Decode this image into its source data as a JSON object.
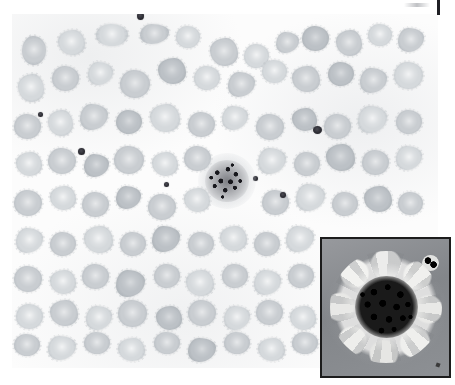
{
  "figure": {
    "kind": "micrograph",
    "caption": "",
    "background_color": "#ffffff"
  },
  "main_panel": {
    "name": "main-micrograph",
    "description": "Light-field peripheral blood smear showing numerous pale gray crenated red blood cells (echinocytes) on a white background, with a single dark basophilic granular cell cluster near the center and several small dark platelets scattered across the field.",
    "field_color": "#fcfcfc",
    "cell_color": "#c9cdd1",
    "cell_color_light": "#d5d9dc",
    "cell_color_dark": "#bcc1c6",
    "dark_object_color": "#17171c",
    "bounds": {
      "x": 12,
      "y": 14,
      "width": 426,
      "height": 354
    },
    "red_blood_cells": [
      {
        "x": 22,
        "y": 36,
        "w": 24,
        "h": 29,
        "tone": "base",
        "shape": "sp"
      },
      {
        "x": 58,
        "y": 30,
        "w": 27,
        "h": 25,
        "tone": "light",
        "shape": "sp2"
      },
      {
        "x": 96,
        "y": 24,
        "w": 32,
        "h": 22,
        "tone": "light",
        "shape": "sp"
      },
      {
        "x": 140,
        "y": 24,
        "w": 29,
        "h": 20,
        "tone": "base",
        "shape": "sp3"
      },
      {
        "x": 176,
        "y": 26,
        "w": 24,
        "h": 22,
        "tone": "light",
        "shape": "sp"
      },
      {
        "x": 210,
        "y": 38,
        "w": 28,
        "h": 28,
        "tone": "base",
        "shape": "sp2"
      },
      {
        "x": 244,
        "y": 44,
        "w": 25,
        "h": 24,
        "tone": "light",
        "shape": "sp"
      },
      {
        "x": 276,
        "y": 32,
        "w": 23,
        "h": 21,
        "tone": "base",
        "shape": "sp3"
      },
      {
        "x": 302,
        "y": 26,
        "w": 27,
        "h": 25,
        "tone": "dark",
        "shape": "sp"
      },
      {
        "x": 336,
        "y": 30,
        "w": 26,
        "h": 26,
        "tone": "base",
        "shape": "sp2"
      },
      {
        "x": 368,
        "y": 24,
        "w": 24,
        "h": 22,
        "tone": "light",
        "shape": "sp"
      },
      {
        "x": 398,
        "y": 28,
        "w": 26,
        "h": 24,
        "tone": "base",
        "shape": "sp3"
      },
      {
        "x": 18,
        "y": 74,
        "w": 26,
        "h": 28,
        "tone": "light",
        "shape": "sp2"
      },
      {
        "x": 52,
        "y": 66,
        "w": 27,
        "h": 25,
        "tone": "base",
        "shape": "sp"
      },
      {
        "x": 88,
        "y": 62,
        "w": 25,
        "h": 23,
        "tone": "light",
        "shape": "sp3"
      },
      {
        "x": 120,
        "y": 70,
        "w": 30,
        "h": 28,
        "tone": "base",
        "shape": "sp"
      },
      {
        "x": 158,
        "y": 58,
        "w": 28,
        "h": 26,
        "tone": "dark",
        "shape": "sp2"
      },
      {
        "x": 194,
        "y": 66,
        "w": 26,
        "h": 24,
        "tone": "light",
        "shape": "sp"
      },
      {
        "x": 228,
        "y": 72,
        "w": 27,
        "h": 25,
        "tone": "base",
        "shape": "sp3"
      },
      {
        "x": 262,
        "y": 60,
        "w": 25,
        "h": 23,
        "tone": "light",
        "shape": "sp"
      },
      {
        "x": 292,
        "y": 66,
        "w": 28,
        "h": 26,
        "tone": "base",
        "shape": "sp2"
      },
      {
        "x": 328,
        "y": 62,
        "w": 26,
        "h": 24,
        "tone": "dark",
        "shape": "sp"
      },
      {
        "x": 360,
        "y": 68,
        "w": 27,
        "h": 25,
        "tone": "base",
        "shape": "sp3"
      },
      {
        "x": 394,
        "y": 62,
        "w": 29,
        "h": 27,
        "tone": "light",
        "shape": "sp"
      },
      {
        "x": 14,
        "y": 114,
        "w": 27,
        "h": 25,
        "tone": "base",
        "shape": "sp"
      },
      {
        "x": 48,
        "y": 110,
        "w": 25,
        "h": 26,
        "tone": "light",
        "shape": "sp2"
      },
      {
        "x": 80,
        "y": 104,
        "w": 28,
        "h": 26,
        "tone": "base",
        "shape": "sp3"
      },
      {
        "x": 116,
        "y": 110,
        "w": 26,
        "h": 24,
        "tone": "dark",
        "shape": "sp"
      },
      {
        "x": 150,
        "y": 104,
        "w": 30,
        "h": 28,
        "tone": "light",
        "shape": "sp2"
      },
      {
        "x": 188,
        "y": 112,
        "w": 27,
        "h": 25,
        "tone": "base",
        "shape": "sp"
      },
      {
        "x": 222,
        "y": 106,
        "w": 26,
        "h": 24,
        "tone": "light",
        "shape": "sp3"
      },
      {
        "x": 256,
        "y": 114,
        "w": 28,
        "h": 26,
        "tone": "base",
        "shape": "sp"
      },
      {
        "x": 292,
        "y": 108,
        "w": 25,
        "h": 23,
        "tone": "dark",
        "shape": "sp2"
      },
      {
        "x": 324,
        "y": 114,
        "w": 27,
        "h": 25,
        "tone": "base",
        "shape": "sp"
      },
      {
        "x": 358,
        "y": 106,
        "w": 29,
        "h": 27,
        "tone": "light",
        "shape": "sp3"
      },
      {
        "x": 396,
        "y": 110,
        "w": 26,
        "h": 24,
        "tone": "base",
        "shape": "sp"
      },
      {
        "x": 16,
        "y": 152,
        "w": 26,
        "h": 24,
        "tone": "light",
        "shape": "sp2"
      },
      {
        "x": 48,
        "y": 148,
        "w": 28,
        "h": 26,
        "tone": "base",
        "shape": "sp"
      },
      {
        "x": 84,
        "y": 154,
        "w": 25,
        "h": 23,
        "tone": "dark",
        "shape": "sp3"
      },
      {
        "x": 114,
        "y": 146,
        "w": 30,
        "h": 28,
        "tone": "base",
        "shape": "sp"
      },
      {
        "x": 152,
        "y": 152,
        "w": 26,
        "h": 24,
        "tone": "light",
        "shape": "sp2"
      },
      {
        "x": 184,
        "y": 146,
        "w": 27,
        "h": 25,
        "tone": "base",
        "shape": "sp"
      },
      {
        "x": 258,
        "y": 148,
        "w": 28,
        "h": 26,
        "tone": "light",
        "shape": "sp3"
      },
      {
        "x": 294,
        "y": 152,
        "w": 26,
        "h": 24,
        "tone": "base",
        "shape": "sp"
      },
      {
        "x": 326,
        "y": 144,
        "w": 29,
        "h": 27,
        "tone": "dark",
        "shape": "sp2"
      },
      {
        "x": 362,
        "y": 150,
        "w": 27,
        "h": 25,
        "tone": "base",
        "shape": "sp"
      },
      {
        "x": 396,
        "y": 146,
        "w": 26,
        "h": 24,
        "tone": "light",
        "shape": "sp3"
      },
      {
        "x": 14,
        "y": 190,
        "w": 28,
        "h": 26,
        "tone": "base",
        "shape": "sp"
      },
      {
        "x": 50,
        "y": 186,
        "w": 26,
        "h": 24,
        "tone": "light",
        "shape": "sp2"
      },
      {
        "x": 82,
        "y": 192,
        "w": 27,
        "h": 25,
        "tone": "base",
        "shape": "sp"
      },
      {
        "x": 116,
        "y": 186,
        "w": 25,
        "h": 23,
        "tone": "dark",
        "shape": "sp3"
      },
      {
        "x": 148,
        "y": 194,
        "w": 28,
        "h": 26,
        "tone": "base",
        "shape": "sp"
      },
      {
        "x": 184,
        "y": 188,
        "w": 26,
        "h": 24,
        "tone": "light",
        "shape": "sp2"
      },
      {
        "x": 262,
        "y": 190,
        "w": 27,
        "h": 25,
        "tone": "base",
        "shape": "sp"
      },
      {
        "x": 296,
        "y": 184,
        "w": 29,
        "h": 27,
        "tone": "light",
        "shape": "sp3"
      },
      {
        "x": 332,
        "y": 192,
        "w": 26,
        "h": 24,
        "tone": "base",
        "shape": "sp"
      },
      {
        "x": 364,
        "y": 186,
        "w": 28,
        "h": 26,
        "tone": "dark",
        "shape": "sp2"
      },
      {
        "x": 398,
        "y": 192,
        "w": 25,
        "h": 23,
        "tone": "base",
        "shape": "sp"
      },
      {
        "x": 16,
        "y": 228,
        "w": 27,
        "h": 25,
        "tone": "light",
        "shape": "sp3"
      },
      {
        "x": 50,
        "y": 232,
        "w": 26,
        "h": 24,
        "tone": "base",
        "shape": "sp"
      },
      {
        "x": 84,
        "y": 226,
        "w": 29,
        "h": 27,
        "tone": "light",
        "shape": "sp2"
      },
      {
        "x": 120,
        "y": 232,
        "w": 26,
        "h": 24,
        "tone": "base",
        "shape": "sp"
      },
      {
        "x": 152,
        "y": 226,
        "w": 28,
        "h": 26,
        "tone": "dark",
        "shape": "sp3"
      },
      {
        "x": 188,
        "y": 232,
        "w": 26,
        "h": 24,
        "tone": "base",
        "shape": "sp"
      },
      {
        "x": 220,
        "y": 226,
        "w": 27,
        "h": 25,
        "tone": "light",
        "shape": "sp2"
      },
      {
        "x": 254,
        "y": 232,
        "w": 26,
        "h": 24,
        "tone": "base",
        "shape": "sp"
      },
      {
        "x": 286,
        "y": 226,
        "w": 28,
        "h": 26,
        "tone": "light",
        "shape": "sp3"
      },
      {
        "x": 14,
        "y": 266,
        "w": 28,
        "h": 26,
        "tone": "base",
        "shape": "sp"
      },
      {
        "x": 50,
        "y": 270,
        "w": 26,
        "h": 24,
        "tone": "light",
        "shape": "sp2"
      },
      {
        "x": 82,
        "y": 264,
        "w": 27,
        "h": 25,
        "tone": "base",
        "shape": "sp"
      },
      {
        "x": 116,
        "y": 270,
        "w": 29,
        "h": 27,
        "tone": "dark",
        "shape": "sp3"
      },
      {
        "x": 154,
        "y": 264,
        "w": 26,
        "h": 24,
        "tone": "base",
        "shape": "sp"
      },
      {
        "x": 186,
        "y": 270,
        "w": 28,
        "h": 26,
        "tone": "light",
        "shape": "sp2"
      },
      {
        "x": 222,
        "y": 264,
        "w": 26,
        "h": 24,
        "tone": "base",
        "shape": "sp"
      },
      {
        "x": 254,
        "y": 270,
        "w": 27,
        "h": 25,
        "tone": "light",
        "shape": "sp3"
      },
      {
        "x": 288,
        "y": 264,
        "w": 26,
        "h": 24,
        "tone": "base",
        "shape": "sp"
      },
      {
        "x": 16,
        "y": 304,
        "w": 27,
        "h": 25,
        "tone": "light",
        "shape": "sp"
      },
      {
        "x": 50,
        "y": 300,
        "w": 28,
        "h": 26,
        "tone": "base",
        "shape": "sp2"
      },
      {
        "x": 86,
        "y": 306,
        "w": 26,
        "h": 24,
        "tone": "light",
        "shape": "sp3"
      },
      {
        "x": 118,
        "y": 300,
        "w": 29,
        "h": 27,
        "tone": "base",
        "shape": "sp"
      },
      {
        "x": 156,
        "y": 306,
        "w": 26,
        "h": 24,
        "tone": "dark",
        "shape": "sp2"
      },
      {
        "x": 188,
        "y": 300,
        "w": 28,
        "h": 26,
        "tone": "base",
        "shape": "sp"
      },
      {
        "x": 224,
        "y": 306,
        "w": 26,
        "h": 24,
        "tone": "light",
        "shape": "sp3"
      },
      {
        "x": 256,
        "y": 300,
        "w": 27,
        "h": 25,
        "tone": "base",
        "shape": "sp"
      },
      {
        "x": 290,
        "y": 306,
        "w": 26,
        "h": 24,
        "tone": "light",
        "shape": "sp2"
      },
      {
        "x": 14,
        "y": 334,
        "w": 26,
        "h": 22,
        "tone": "base",
        "shape": "sp"
      },
      {
        "x": 48,
        "y": 336,
        "w": 28,
        "h": 24,
        "tone": "light",
        "shape": "sp3"
      },
      {
        "x": 84,
        "y": 332,
        "w": 26,
        "h": 22,
        "tone": "base",
        "shape": "sp"
      },
      {
        "x": 118,
        "y": 338,
        "w": 27,
        "h": 23,
        "tone": "light",
        "shape": "sp2"
      },
      {
        "x": 154,
        "y": 332,
        "w": 26,
        "h": 22,
        "tone": "base",
        "shape": "sp"
      },
      {
        "x": 188,
        "y": 338,
        "w": 28,
        "h": 24,
        "tone": "dark",
        "shape": "sp3"
      },
      {
        "x": 224,
        "y": 332,
        "w": 26,
        "h": 22,
        "tone": "base",
        "shape": "sp"
      },
      {
        "x": 258,
        "y": 338,
        "w": 27,
        "h": 23,
        "tone": "light",
        "shape": "sp2"
      },
      {
        "x": 292,
        "y": 332,
        "w": 26,
        "h": 22,
        "tone": "base",
        "shape": "sp"
      }
    ],
    "platelets": [
      {
        "x": 137,
        "y": 12,
        "w": 7,
        "h": 8
      },
      {
        "x": 38,
        "y": 112,
        "w": 5,
        "h": 5
      },
      {
        "x": 78,
        "y": 148,
        "w": 7,
        "h": 7
      },
      {
        "x": 164,
        "y": 182,
        "w": 5,
        "h": 5
      },
      {
        "x": 280,
        "y": 192,
        "w": 6,
        "h": 6
      },
      {
        "x": 313,
        "y": 126,
        "w": 9,
        "h": 8
      },
      {
        "x": 253,
        "y": 176,
        "w": 5,
        "h": 5
      }
    ],
    "dark_cell": {
      "label": "dark basophilic granular cell cluster",
      "x": 205,
      "y": 160,
      "w": 44,
      "h": 42
    }
  },
  "inset_panel": {
    "name": "magnified-inset",
    "description": "High-magnification inset of the dark granular cell: a dense black granular nucleus ringed by a corona of pale lumpy granules on a mid-gray background. A smaller dark satellite object sits at the upper right.",
    "bounds": {
      "x": 320,
      "y": 237,
      "width": 131,
      "height": 141
    },
    "border_color": "#1c1c1c",
    "background_color": "#8e9195",
    "nucleus_color": "#0a0a0a",
    "corona_color": "#ececea"
  },
  "artifacts": {
    "edge_bar": {
      "x": 437,
      "y": 0,
      "w": 3,
      "h": 15,
      "color": "#1f1f24"
    },
    "edge_smudge": {
      "x": 404,
      "y": 3,
      "w": 26,
      "h": 4
    }
  }
}
